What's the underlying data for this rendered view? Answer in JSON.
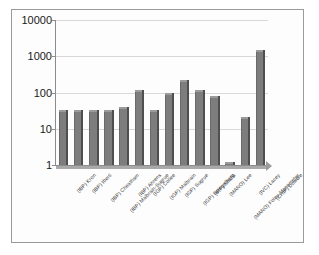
{
  "chart_data": {
    "type": "bar",
    "title": "",
    "subtitle": "",
    "xlabel": "",
    "ylabel": "",
    "scale": "log",
    "grid": true,
    "legend": "none",
    "ylim": [
      1,
      10000
    ],
    "ytick_labels": [
      "10000",
      "1000",
      "100",
      "10",
      "1"
    ],
    "ytick_values": [
      10000,
      1000,
      100,
      10,
      1
    ],
    "categories": [
      "(IBP) Kron",
      "(IBP) Iberti",
      "(IBP) Cheatham",
      "(IBP) Malbrain-Sugrue",
      "(IBP) Ahrens",
      "(IGP) Collee",
      "(IGP) Malbrain",
      "(IGP) Sugrue",
      "(IGP) Spiegelberg",
      "(IRP) Shafik",
      "(MANO) Lee",
      "(MANO) Foley-Manometer",
      "(IVC) Lacey",
      "(CHIP) Dowdle"
    ],
    "values": [
      32,
      32,
      32,
      32,
      40,
      120,
      33,
      95,
      225,
      118,
      80,
      1.2,
      21,
      1500
    ],
    "series": [
      {
        "name": "Citations",
        "values": [
          32,
          32,
          32,
          32,
          40,
          120,
          33,
          95,
          225,
          118,
          80,
          1.2,
          21,
          1500
        ]
      }
    ],
    "bar_color": "#7d7d7d",
    "bar_edge_color": "#4f4f4f",
    "axis_color": "#8c8c8c",
    "grid_color": "#d8d8d8",
    "frame_color": "#9a9a9a",
    "background_color": "#ffffff"
  }
}
